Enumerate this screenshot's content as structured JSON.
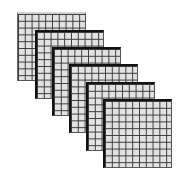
{
  "diagram": {
    "rows": 10,
    "cols": 10,
    "cell_fill": "#e2e2e2",
    "line_color": "#3a3a3a",
    "grids": [
      {
        "id": 1,
        "x": 17,
        "y": 12
      },
      {
        "id": 2,
        "x": 35,
        "y": 30
      },
      {
        "id": 3,
        "x": 52,
        "y": 47
      },
      {
        "id": 4,
        "x": 69,
        "y": 64
      },
      {
        "id": 5,
        "x": 86,
        "y": 82
      },
      {
        "id": 6,
        "x": 103,
        "y": 99
      }
    ]
  }
}
